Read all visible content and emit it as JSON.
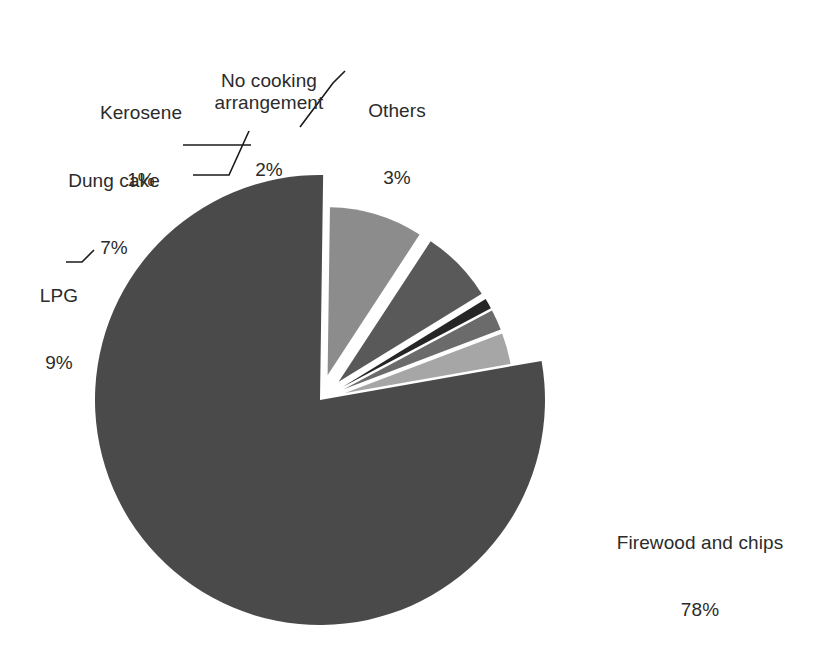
{
  "chart_data": {
    "type": "pie",
    "title": "",
    "subtitle": "",
    "xlabel": "",
    "ylabel": "",
    "legend": "none",
    "grid": false,
    "units": "percent",
    "total": 100,
    "categories": [
      "Firewood and chips",
      "LPG",
      "Dung cake",
      "Kerosene",
      "No cooking arrangement",
      "Others"
    ],
    "values": [
      78,
      9,
      7,
      1,
      2,
      3
    ],
    "value_labels": [
      "78%",
      "9%",
      "7%",
      "1%",
      "2%",
      "3%"
    ],
    "slices": [
      {
        "label": "Firewood and chips",
        "value": 78,
        "value_label": "78%",
        "color": "#4a4a4a",
        "exploded": false,
        "start_angle_deg": 350.0,
        "end_angle_deg": 630.8
      },
      {
        "label": "LPG",
        "value": 9,
        "value_label": "9%",
        "color": "#8c8c8c",
        "exploded": true,
        "start_angle_deg": 270.8,
        "end_angle_deg": 303.2
      },
      {
        "label": "Dung cake",
        "value": 7,
        "value_label": "7%",
        "color": "#595959",
        "exploded": true,
        "start_angle_deg": 303.2,
        "end_angle_deg": 328.4
      },
      {
        "label": "Kerosene",
        "value": 1,
        "value_label": "1%",
        "color": "#262626",
        "exploded": true,
        "start_angle_deg": 328.4,
        "end_angle_deg": 332.0
      },
      {
        "label": "No cooking arrangement",
        "value": 2,
        "value_label": "2%",
        "color": "#6b6b6b",
        "exploded": true,
        "start_angle_deg": 332.0,
        "end_angle_deg": 339.2
      },
      {
        "label": "Others",
        "value": 3,
        "value_label": "3%",
        "color": "#a6a6a6",
        "exploded": true,
        "start_angle_deg": 339.2,
        "end_angle_deg": 350.0
      }
    ]
  },
  "colors": {
    "background": "#ffffff",
    "text": "#2b2b2b",
    "leader_line": "#1a1a1a",
    "firewood_and_chips": "#4a4a4a",
    "lpg": "#8c8c8c",
    "dung_cake": "#595959",
    "kerosene": "#262626",
    "no_cooking_arrangement": "#6b6b6b",
    "others": "#a6a6a6"
  },
  "labels": {
    "firewood": {
      "name": "Firewood and chips",
      "value": "78%"
    },
    "lpg": {
      "name": "LPG",
      "value": "9%"
    },
    "dung_cake": {
      "name": "Dung cake",
      "value": "7%"
    },
    "kerosene": {
      "name": "Kerosene",
      "value": "1%"
    },
    "no_cooking": {
      "name": "No cooking\narrangement",
      "value": "2%"
    },
    "others": {
      "name": "Others",
      "value": "3%"
    }
  }
}
